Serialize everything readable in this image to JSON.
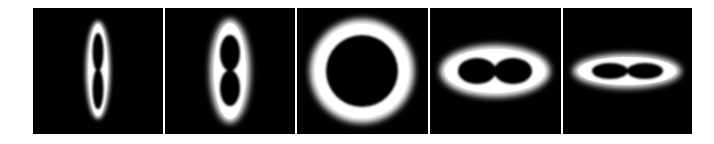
{
  "figure": {
    "description": "Five-panel sequence of glowing white intensity rings on black backgrounds, morphing from a vertical figure-eight to a circle to a horizontal figure-eight",
    "background_color": "#ffffff",
    "panel_color": "#000000",
    "glow_color": "#ffffff",
    "panels": [
      {
        "index": 1,
        "label": "vertical-figure-eight-narrow",
        "shape": "vertical two-lobed ring"
      },
      {
        "index": 2,
        "label": "vertical-figure-eight-wide",
        "shape": "vertical two-lobed ring"
      },
      {
        "index": 3,
        "label": "circular-ring",
        "shape": "circular ring"
      },
      {
        "index": 4,
        "label": "horizontal-figure-eight-wide",
        "shape": "horizontal two-lobed ring"
      },
      {
        "index": 5,
        "label": "horizontal-figure-eight-narrow",
        "shape": "horizontal two-lobed ring"
      }
    ]
  }
}
